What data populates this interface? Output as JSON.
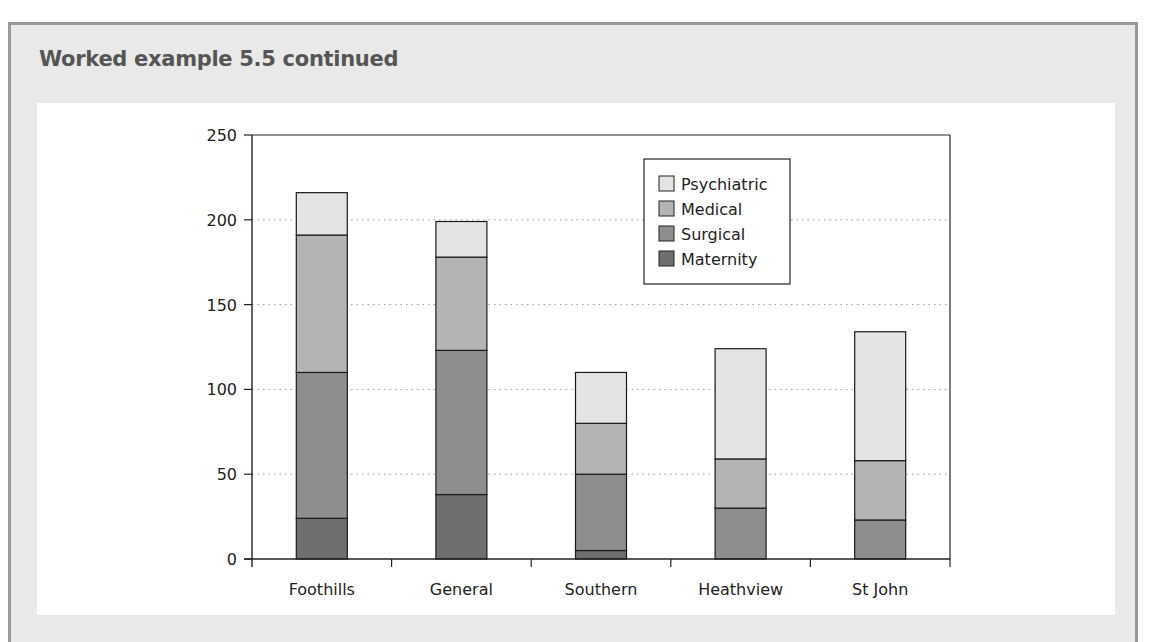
{
  "header": {
    "title": "Worked example 5.5 continued"
  },
  "chart_data": {
    "type": "bar",
    "stacked": true,
    "title": "",
    "xlabel": "",
    "ylabel": "",
    "categories": [
      "Foothills",
      "General",
      "Southern",
      "Heathview",
      "St John"
    ],
    "series": [
      {
        "name": "Maternity",
        "color": "#6f6f6f",
        "values": [
          24,
          38,
          5,
          0,
          0
        ]
      },
      {
        "name": "Surgical",
        "color": "#8e8e8e",
        "values": [
          86,
          85,
          45,
          30,
          23
        ]
      },
      {
        "name": "Medical",
        "color": "#b4b4b4",
        "values": [
          81,
          55,
          30,
          29,
          35
        ]
      },
      {
        "name": "Psychiatric",
        "color": "#e4e4e4",
        "values": [
          25,
          21,
          30,
          65,
          76
        ]
      }
    ],
    "legend_order": [
      "Psychiatric",
      "Medical",
      "Surgical",
      "Maternity"
    ],
    "legend_position": "upper right inside plot",
    "ylim": [
      0,
      250
    ],
    "yticks": [
      0,
      50,
      100,
      150,
      200,
      250
    ],
    "grid": "horizontal dotted"
  }
}
